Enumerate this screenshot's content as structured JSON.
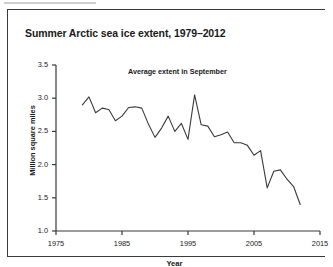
{
  "figure": {
    "title": "Summer Arctic sea ice extent, 1979–2012",
    "subtitle": "Average extent in September",
    "xlabel": "Year",
    "ylabel": "Million square miles"
  },
  "colors": {
    "line": "#3a3a3a",
    "axis": "#3a3a3a",
    "text": "#1a1a1a",
    "background": "#ffffff"
  },
  "chart_data": {
    "type": "line",
    "title": "Summer Arctic sea ice extent, 1979–2012",
    "subtitle": "Average extent in September",
    "xlabel": "Year",
    "ylabel": "Million square miles",
    "xlim": [
      1975,
      2015
    ],
    "ylim": [
      1.0,
      3.5
    ],
    "xticks": [
      1975,
      1985,
      1995,
      2005,
      2015
    ],
    "xtick_labels": [
      "1975",
      "1985",
      "1995",
      "2005",
      "2015"
    ],
    "yticks": [
      1.0,
      1.5,
      2.0,
      2.5,
      3.0,
      3.5
    ],
    "ytick_labels": [
      "1.0",
      "1.5",
      "2.0",
      "2.5",
      "3.0",
      "3.5"
    ],
    "grid": false,
    "legend": false,
    "series": [
      {
        "name": "Average extent in September",
        "x": [
          1979,
          1980,
          1981,
          1982,
          1983,
          1984,
          1985,
          1986,
          1987,
          1988,
          1989,
          1990,
          1991,
          1992,
          1993,
          1994,
          1995,
          1996,
          1997,
          1998,
          1999,
          2000,
          2001,
          2002,
          2003,
          2004,
          2005,
          2006,
          2007,
          2008,
          2009,
          2010,
          2011,
          2012
        ],
        "values": [
          2.9,
          3.02,
          2.78,
          2.85,
          2.83,
          2.66,
          2.73,
          2.86,
          2.87,
          2.85,
          2.61,
          2.41,
          2.55,
          2.73,
          2.5,
          2.62,
          2.38,
          3.05,
          2.6,
          2.58,
          2.42,
          2.45,
          2.49,
          2.33,
          2.33,
          2.29,
          2.14,
          2.21,
          1.65,
          1.9,
          1.92,
          1.78,
          1.67,
          1.4
        ]
      }
    ],
    "annotations": []
  }
}
